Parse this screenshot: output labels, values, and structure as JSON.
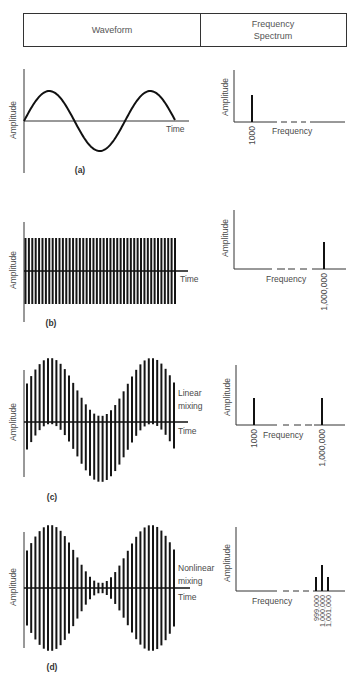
{
  "header": {
    "waveform": "Waveform",
    "spectrum_line1": "Frequency",
    "spectrum_line2": "Spectrum"
  },
  "panels": {
    "a": {
      "label": "(a)",
      "waveform": {
        "ylabel": "Amplitude",
        "xlabel": "Time",
        "signal": "sine",
        "cycles": 1.5
      },
      "spectrum": {
        "ylabel": "Amplitude",
        "xlabel": "Frequency",
        "components": [
          {
            "freq_label": "1000",
            "rel_amplitude": 0.5
          }
        ]
      }
    },
    "b": {
      "label": "(b)",
      "waveform": {
        "ylabel": "Amplitude",
        "xlabel": "Time",
        "signal": "carrier",
        "bar_count": 45
      },
      "spectrum": {
        "ylabel": "Amplitude",
        "xlabel": "Frequency",
        "components": [
          {
            "freq_label": "1,000,000",
            "rel_amplitude": 0.45
          }
        ]
      }
    },
    "c": {
      "label": "(c)",
      "waveform": {
        "ylabel": "Amplitude",
        "xlabel": "Time",
        "note_line1": "Linear",
        "note_line2": "mixing",
        "signal": "sum",
        "bar_count": 36
      },
      "spectrum": {
        "ylabel": "Amplitude",
        "xlabel": "Frequency",
        "components": [
          {
            "freq_label": "1000",
            "rel_amplitude": 0.45
          },
          {
            "freq_label": "1,000,000",
            "rel_amplitude": 0.45
          }
        ]
      }
    },
    "d": {
      "label": "(d)",
      "waveform": {
        "ylabel": "Amplitude",
        "xlabel": "Time",
        "note_line1": "Nonlinear",
        "note_line2": "mixing",
        "signal": "amplitude-modulated",
        "bar_count": 36
      },
      "spectrum": {
        "ylabel": "Amplitude",
        "xlabel": "Frequency",
        "components": [
          {
            "freq_label": "999,000",
            "rel_amplitude": 0.22
          },
          {
            "freq_label": "1,000,000",
            "rel_amplitude": 0.4
          },
          {
            "freq_label": "1,001,000",
            "rel_amplitude": 0.22
          }
        ]
      }
    }
  }
}
